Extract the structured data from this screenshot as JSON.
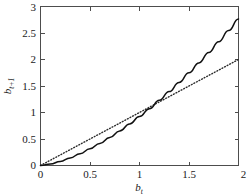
{
  "chart_data": {
    "type": "line",
    "title": "",
    "subtitle": "",
    "xlabel": "b_t",
    "xlabel_base": "b",
    "xlabel_sub": "t",
    "ylabel": "b_t+1",
    "ylabel_base": "b",
    "ylabel_sub": "t+1",
    "xlim": [
      0,
      2
    ],
    "ylim": [
      0,
      3
    ],
    "grid": false,
    "legend": "none",
    "background_color": "#ffffff",
    "frame_color": "#4d4d4d",
    "xticks": [
      0,
      0.5,
      1,
      1.5,
      2
    ],
    "xticklabels": [
      "0",
      "0.5",
      "1",
      "1.5",
      "2"
    ],
    "yticks": [
      0,
      0.5,
      1,
      1.5,
      2,
      2.5,
      3
    ],
    "yticklabels": [
      "0",
      "0.5",
      "1",
      "1.5",
      "2",
      "2.5",
      "3"
    ],
    "series": [
      {
        "name": "transition-curve",
        "style": "solid",
        "color": "#111111",
        "x": [
          0,
          0.1,
          0.2,
          0.3,
          0.4,
          0.5,
          0.6,
          0.7,
          0.8,
          0.9,
          1.0,
          1.1,
          1.2,
          1.3,
          1.4,
          1.5,
          1.6,
          1.7,
          1.8,
          1.9,
          2.0
        ],
        "values": [
          0,
          0.026,
          0.077,
          0.143,
          0.223,
          0.315,
          0.417,
          0.53,
          0.652,
          0.783,
          0.923,
          1.072,
          1.229,
          1.394,
          1.567,
          1.748,
          1.936,
          2.132,
          2.335,
          2.545,
          2.762
        ]
      },
      {
        "name": "forty-five-degree-line",
        "style": "dotted",
        "color": "#2b2b2b",
        "x": [
          0,
          2.0
        ],
        "values": [
          0,
          2.0
        ]
      }
    ]
  }
}
